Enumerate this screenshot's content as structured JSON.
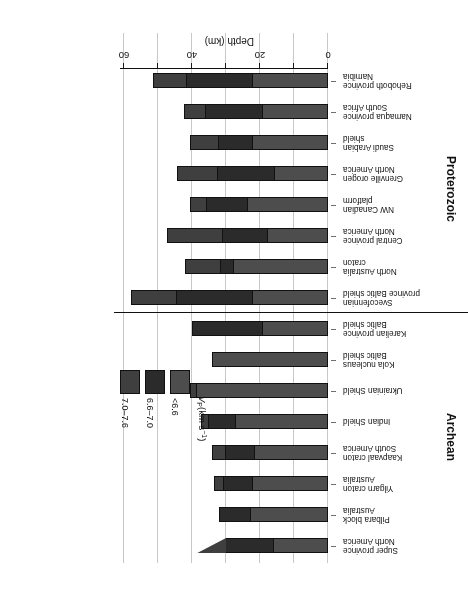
{
  "chart_data": {
    "type": "bar",
    "orientation": "horizontal",
    "stacked": true,
    "title": "",
    "xlabel": "Depth (km)",
    "ylabel": "",
    "xlim": [
      0,
      65
    ],
    "xticks": [
      0,
      20,
      40,
      60
    ],
    "xticklabels": [
      "0",
      "20",
      "40",
      "60"
    ],
    "gridlines": [
      0,
      10,
      20,
      30,
      40,
      50,
      60
    ],
    "grid": true,
    "rotated_180": true,
    "legend": {
      "title": "VP(km s-1)",
      "title_parts": {
        "v": "V",
        "p": "P",
        "unit_main": "(km s",
        "unit_exp": "−1",
        "unit_close": ")"
      },
      "position": "inside-right",
      "entries": [
        {
          "label": "<6.6",
          "color": "#4d4d4d"
        },
        {
          "label": "6.6–7.0",
          "color": "#2b2b2b"
        },
        {
          "label": "7.0–7.6",
          "color": "#3f3f3f"
        }
      ]
    },
    "series": [
      {
        "name": "<6.6",
        "color": "#4d4d4d"
      },
      {
        "name": "6.6–7.0",
        "color": "#2b2b2b"
      },
      {
        "name": "7.0–7.6",
        "color": "#3f3f3f"
      }
    ],
    "groups": [
      {
        "name": "Archean",
        "bars": [
          {
            "label_line1": "Super province",
            "label_line2": "North America",
            "tapered": true,
            "values": [
              16.0,
              14.0,
              5.5
            ]
          },
          {
            "label_line1": "Pilbara block",
            "label_line2": "Australia",
            "tapered": false,
            "values": [
              22.5,
              9.5,
              0.0
            ]
          },
          {
            "label_line1": "Yilgarn craton",
            "label_line2": "Australia",
            "tapered": false,
            "values": [
              22.0,
              8.5,
              3.0
            ]
          },
          {
            "label_line1": "Kaapvaal craton",
            "label_line2": "South America",
            "tapered": false,
            "values": [
              21.5,
              8.5,
              4.0
            ]
          },
          {
            "label_line1": "Indian Shield",
            "label_line2": "",
            "tapered": false,
            "values": [
              27.0,
              8.0,
              2.5
            ]
          },
          {
            "label_line1": "Ukrainian Shield",
            "label_line2": "",
            "tapered": false,
            "values": [
              38.5,
              0.0,
              2.0
            ]
          },
          {
            "label_line1": "Kola nucleaus",
            "label_line2": "Baltic shield",
            "tapered": false,
            "values": [
              34.0,
              0.0,
              0.0
            ]
          },
          {
            "label_line1": "Karelian province",
            "label_line2": "Baltic shield",
            "tapered": false,
            "values": [
              19.0,
              21.0,
              0.0
            ]
          }
        ]
      },
      {
        "name": "Proterozoic",
        "bars": [
          {
            "label_line1": "Svecofennian",
            "label_line2": "province Baltic shield",
            "tapered": false,
            "values": [
              22.0,
              22.5,
              13.5
            ]
          },
          {
            "label_line1": "North Australia",
            "label_line2": "craton",
            "tapered": false,
            "values": [
              27.5,
              4.0,
              10.5
            ]
          },
          {
            "label_line1": "Central province",
            "label_line2": "North America",
            "tapered": false,
            "values": [
              17.5,
              13.5,
              16.5
            ]
          },
          {
            "label_line1": "NW Canadian",
            "label_line2": "platform",
            "tapered": false,
            "values": [
              23.5,
              12.0,
              5.0
            ]
          },
          {
            "label_line1": "Grenville orogen",
            "label_line2": "North America",
            "tapered": false,
            "values": [
              15.5,
              17.0,
              12.0
            ]
          },
          {
            "label_line1": "Saudi Arabian",
            "label_line2": "shield",
            "tapered": false,
            "values": [
              22.0,
              10.0,
              8.5
            ]
          },
          {
            "label_line1": "Namaqua province",
            "label_line2": "South Africa",
            "tapered": false,
            "values": [
              19.0,
              17.0,
              6.5
            ]
          },
          {
            "label_line1": "Rehoboth province",
            "label_line2": "Namibia",
            "tapered": false,
            "values": [
              22.0,
              19.5,
              10.0
            ]
          }
        ]
      }
    ]
  }
}
